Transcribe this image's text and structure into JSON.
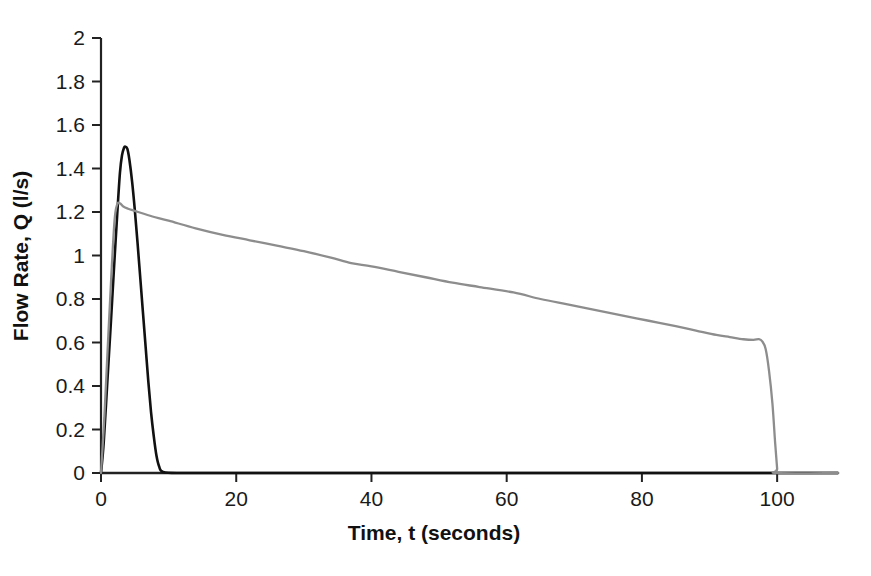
{
  "chart_data": {
    "type": "line",
    "title": "",
    "xlabel": "Time, t (seconds)",
    "ylabel": "Flow Rate, Q (l/s)",
    "xlim": [
      0,
      109
    ],
    "ylim": [
      0,
      2
    ],
    "xticks": [
      0,
      20,
      40,
      60,
      80,
      100
    ],
    "yticks": [
      0,
      0.2,
      0.4,
      0.6,
      0.8,
      1,
      1.2,
      1.4,
      1.6,
      1.8,
      2
    ],
    "xtick_labels": [
      "0",
      "20",
      "40",
      "60",
      "80",
      "100"
    ],
    "ytick_labels": [
      "0",
      "0.2",
      "0.4",
      "0.6",
      "0.8",
      "1",
      "1.2",
      "1.4",
      "1.6",
      "1.8",
      "2"
    ],
    "grid": false,
    "legend": "none",
    "series": [
      {
        "name": "black-curve",
        "color": "#111111",
        "linewidth": 2.6,
        "x": [
          0,
          0.4,
          0.9,
          1.4,
          1.9,
          2.4,
          2.8,
          3.1,
          3.4,
          3.6,
          3.9,
          4.2,
          4.6,
          5.0,
          5.4,
          5.8,
          6.2,
          6.6,
          7.0,
          7.4,
          7.8,
          8.2,
          8.6,
          9.2,
          12,
          20,
          40,
          60,
          80,
          100,
          109
        ],
        "y": [
          0,
          0.14,
          0.4,
          0.66,
          0.93,
          1.19,
          1.38,
          1.46,
          1.495,
          1.5,
          1.49,
          1.44,
          1.34,
          1.21,
          1.06,
          0.9,
          0.74,
          0.58,
          0.42,
          0.28,
          0.17,
          0.08,
          0.03,
          0.005,
          0,
          0,
          0,
          0,
          0,
          0,
          0
        ]
      },
      {
        "name": "grey-curve",
        "color": "#8d8d8d",
        "linewidth": 2.3,
        "x": [
          0,
          0.5,
          1.0,
          1.5,
          2.0,
          2.4,
          2.8,
          3.3,
          4.0,
          5.0,
          7.0,
          10,
          14,
          18,
          22,
          26,
          30,
          34,
          37,
          40,
          44,
          48,
          52,
          56,
          61,
          65,
          69,
          73,
          77,
          81,
          85,
          88,
          91,
          93,
          95,
          96.5,
          97.3,
          97.8,
          98.3,
          98.8,
          99.3,
          99.7,
          100,
          100,
          109
        ],
        "y": [
          0,
          0.26,
          0.58,
          0.89,
          1.16,
          1.235,
          1.24,
          1.225,
          1.215,
          1.205,
          1.185,
          1.16,
          1.125,
          1.095,
          1.07,
          1.045,
          1.02,
          0.99,
          0.965,
          0.95,
          0.925,
          0.9,
          0.875,
          0.855,
          0.83,
          0.8,
          0.775,
          0.75,
          0.725,
          0.7,
          0.675,
          0.655,
          0.635,
          0.625,
          0.615,
          0.612,
          0.615,
          0.605,
          0.57,
          0.47,
          0.32,
          0.14,
          0.02,
          0,
          0
        ]
      }
    ]
  },
  "axis": {
    "x_label": "Time, t (seconds)",
    "y_label": "Flow Rate, Q (l/s)"
  },
  "caption": {
    "cut_off_text": ""
  }
}
